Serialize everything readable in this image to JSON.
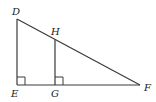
{
  "diagram": {
    "type": "geometry",
    "vertices": {
      "D": {
        "label": "D",
        "x": 17,
        "y": 19
      },
      "E": {
        "label": "E",
        "x": 17,
        "y": 85
      },
      "F": {
        "label": "F",
        "x": 140,
        "y": 85
      },
      "G": {
        "label": "G",
        "x": 55,
        "y": 85
      },
      "H": {
        "label": "H",
        "x": 55,
        "y": 39
      }
    },
    "segments": [
      "DE",
      "EF",
      "DF",
      "HG"
    ],
    "right_angles": [
      "E",
      "G"
    ],
    "labels": {
      "D": "D",
      "E": "E",
      "F": "F",
      "G": "G",
      "H": "H"
    },
    "colors": {
      "line": "#3a3a3a",
      "text": "#222222",
      "background": "#ffffff"
    }
  }
}
